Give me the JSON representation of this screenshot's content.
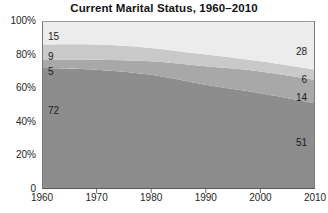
{
  "chart_data": {
    "type": "area",
    "title": "Current Marital Status, 1960–2010",
    "subtitle": "",
    "xlabel": "",
    "ylabel": "",
    "stacked": true,
    "stack_mode": "percent",
    "grid": false,
    "legend_position": "none",
    "x": [
      1960,
      1970,
      1980,
      1990,
      2000,
      2010
    ],
    "xlim": [
      1960,
      2010
    ],
    "ylim": [
      0,
      100
    ],
    "xticks": [
      1960,
      1970,
      1980,
      1990,
      2000,
      2010
    ],
    "xtick_labels": [
      "1960",
      "1970",
      "1980",
      "1990",
      "2000",
      "2010"
    ],
    "yticks": [
      0,
      20,
      40,
      60,
      80,
      100
    ],
    "ytick_labels": [
      "0",
      "20%",
      "40%",
      "60%",
      "80%",
      "100%"
    ],
    "series": [
      {
        "name": "Married",
        "color": "#8d8d8d",
        "values": [
          72,
          71,
          68,
          62,
          57,
          51
        ],
        "start_label": "72",
        "end_label": "51"
      },
      {
        "name": "Divorced",
        "color": "#a8a8a8",
        "values": [
          5,
          6,
          8,
          11,
          13,
          14
        ],
        "start_label": "5",
        "end_label": "14"
      },
      {
        "name": "Widowed",
        "color": "#c9c9c9",
        "values": [
          9,
          9,
          8,
          7,
          6,
          6
        ],
        "start_label": "9",
        "end_label": "6"
      },
      {
        "name": "Never married",
        "color": "#ececec",
        "values": [
          15,
          15,
          17,
          21,
          25,
          28
        ],
        "start_label": "15",
        "end_label": "28"
      }
    ],
    "annotations_left": [
      "15",
      "9",
      "5",
      "72"
    ],
    "annotations_right": [
      "28",
      "6",
      "14",
      "51"
    ]
  },
  "axis": {
    "y_labels": [
      "100%",
      "80%",
      "60%",
      "40%",
      "20%",
      "0"
    ],
    "x_labels": [
      "1960",
      "1970",
      "1980",
      "1990",
      "2000",
      "2010"
    ],
    "axis_color": "#6b6b6b",
    "tick_color": "#6b6b6b"
  },
  "colors": {
    "background": "#ffffff",
    "band_married": "#8d8d8d",
    "band_divorced": "#a8a8a8",
    "band_widowed": "#c9c9c9",
    "band_never_married": "#ececec",
    "text": "#1a1a1a",
    "frame": "#7a7a7a"
  },
  "labels": {
    "left_never_married": "15",
    "left_widowed": "9",
    "left_divorced": "5",
    "left_married": "72",
    "right_never_married": "28",
    "right_widowed": "6",
    "right_divorced": "14",
    "right_married": "51"
  }
}
